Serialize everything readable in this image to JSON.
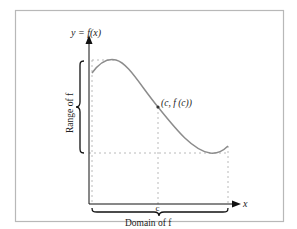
{
  "diagram": {
    "y_axis_label": "y = f(x)",
    "x_axis_label": "x",
    "range_label": "Range of f",
    "domain_label": "Domain of f",
    "point_label": "(c, f (c))",
    "c_tick_label": "c",
    "colors": {
      "frame": "#b5b5b5",
      "axis": "#111111",
      "curve": "#8a8a8a",
      "guide": "#aaaaaa",
      "brace": "#111111"
    }
  }
}
